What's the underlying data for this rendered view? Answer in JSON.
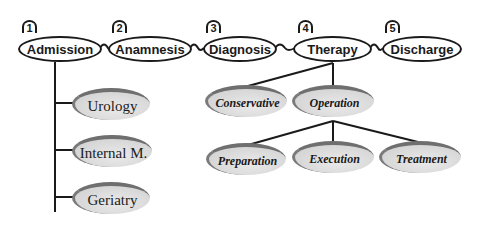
{
  "diagram": {
    "phases": [
      {
        "number": "1",
        "label": "Admission"
      },
      {
        "number": "2",
        "label": "Anamnesis"
      },
      {
        "number": "3",
        "label": "Diagnosis"
      },
      {
        "number": "4",
        "label": "Therapy"
      },
      {
        "number": "5",
        "label": "Discharge"
      }
    ],
    "admission_departments": [
      {
        "label": "Urology"
      },
      {
        "label": "Internal M."
      },
      {
        "label": "Geriatry"
      }
    ],
    "therapy_types": [
      {
        "label": "Conservative"
      },
      {
        "label": "Operation"
      }
    ],
    "operation_steps": [
      {
        "label": "Preparation"
      },
      {
        "label": "Execution"
      },
      {
        "label": "Treatment"
      }
    ],
    "colors": {
      "stroke": "#1a1a1a",
      "sub_fill": "#d9d9d9",
      "sub_shadow": "#6f6f6f"
    }
  }
}
